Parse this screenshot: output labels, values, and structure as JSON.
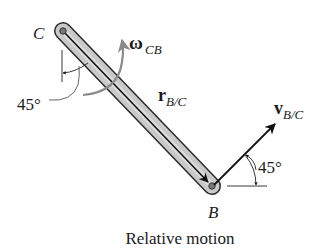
{
  "diagram": {
    "caption": "Relative motion",
    "points": {
      "C": {
        "label": "C"
      },
      "B": {
        "label": "B"
      }
    },
    "rod": {
      "from": "C",
      "to": "B"
    },
    "angular_velocity": {
      "symbol": "ω",
      "subscript": "CB"
    },
    "position_vector": {
      "symbol": "r",
      "subscript": "B/C"
    },
    "velocity_vector": {
      "symbol": "v",
      "subscript": "B/C"
    },
    "angles": {
      "at_C": "45°",
      "at_B": "45°"
    },
    "colors": {
      "rod_fill": "#c8c8c8",
      "rod_outline": "#2a2a2a",
      "omega_arrow": "#8a8a8a",
      "line": "#111111"
    }
  }
}
